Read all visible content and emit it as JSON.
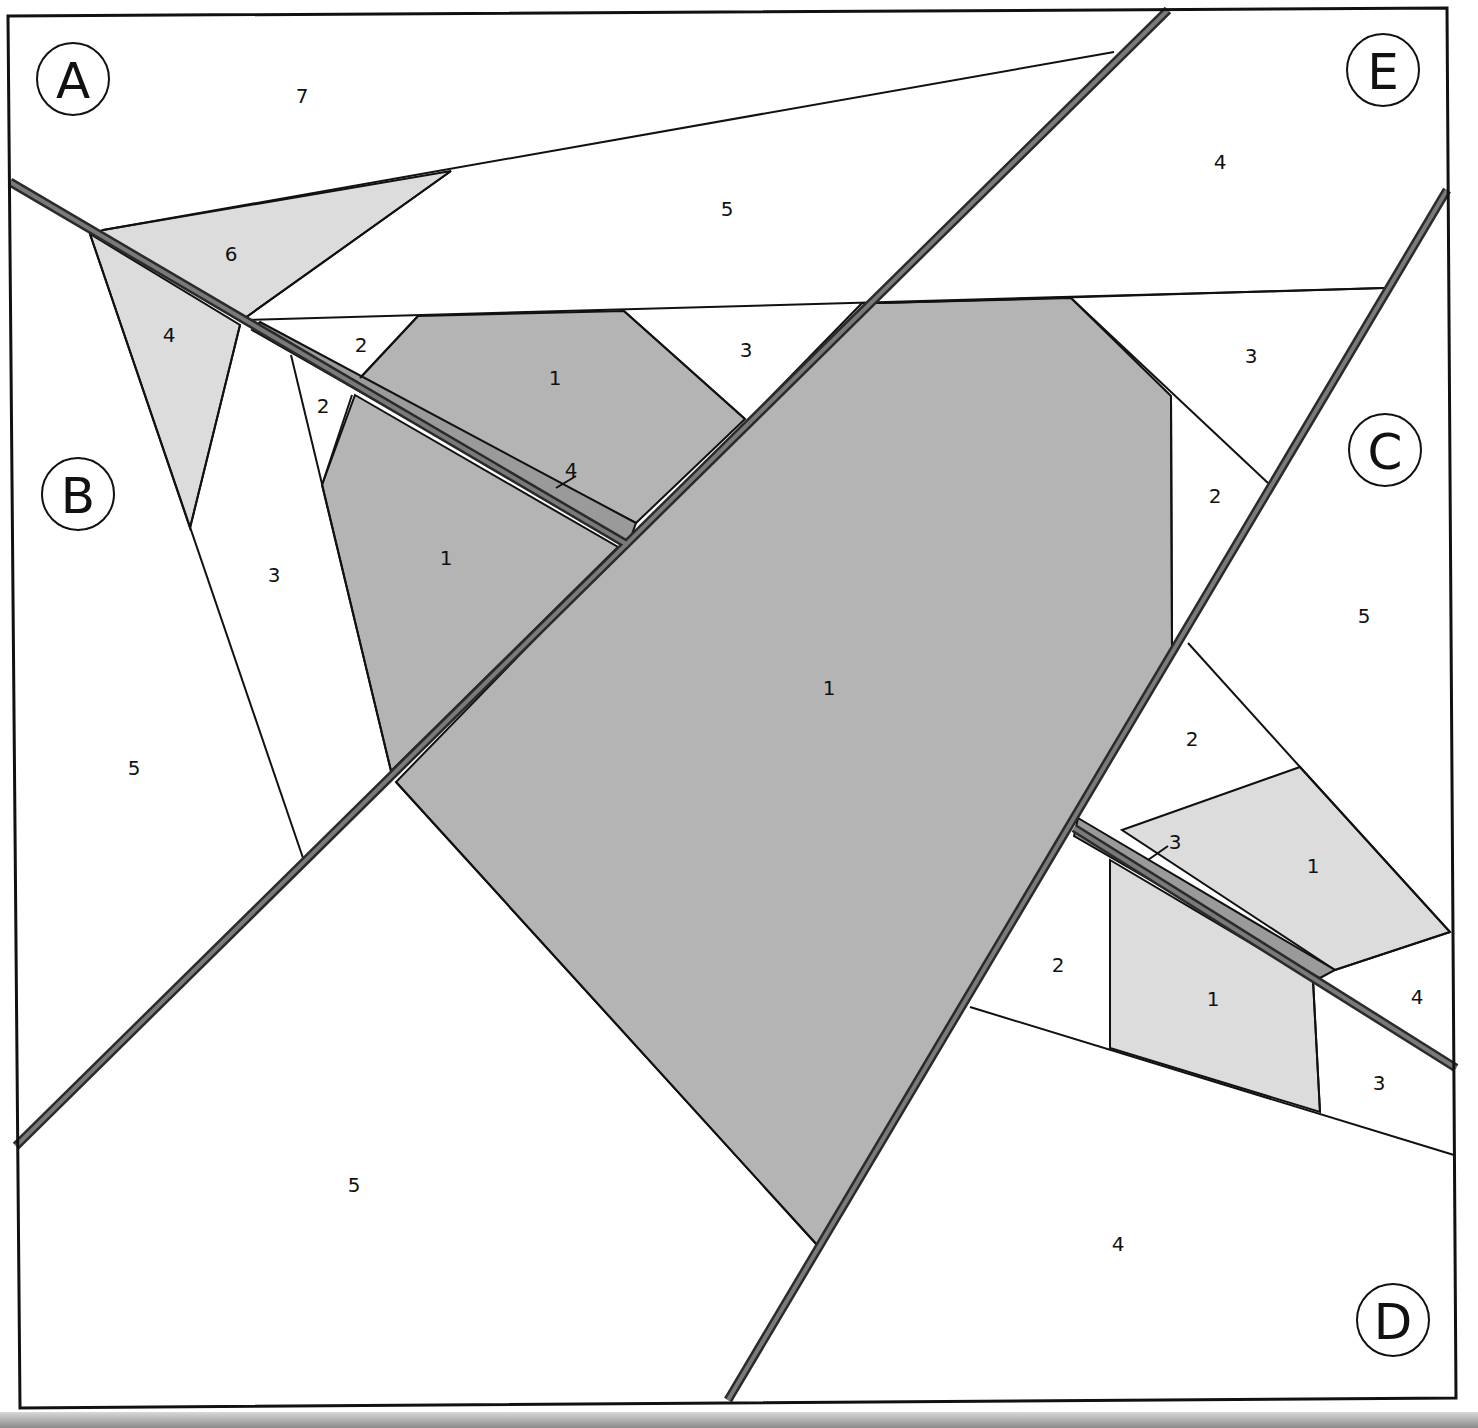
{
  "colors": {
    "dark_fill": "#b4b4b4",
    "light_fill": "#dcdcdc",
    "seam_fill": "#9a9a9a",
    "white": "#ffffff",
    "line": "#111111",
    "seam_outer": "#2a2a2a",
    "seam_inner": "#7a7a7a"
  },
  "sections": [
    {
      "id": "A",
      "x": 73,
      "y": 79
    },
    {
      "id": "B",
      "x": 78,
      "y": 494
    },
    {
      "id": "C",
      "x": 1385,
      "y": 450
    },
    {
      "id": "D",
      "x": 1393,
      "y": 1320
    },
    {
      "id": "E",
      "x": 1383,
      "y": 70
    }
  ],
  "piece_labels": [
    {
      "section": "A",
      "num": "7",
      "x": 302,
      "y": 97
    },
    {
      "section": "A",
      "num": "6",
      "x": 231,
      "y": 255
    },
    {
      "section": "A",
      "num": "5",
      "x": 727,
      "y": 210
    },
    {
      "section": "A",
      "num": "3",
      "x": 746,
      "y": 351
    },
    {
      "section": "A",
      "num": "2",
      "x": 361,
      "y": 346
    },
    {
      "section": "A",
      "num": "1",
      "x": 555,
      "y": 379
    },
    {
      "section": "A",
      "num": "4",
      "x": 571,
      "y": 471
    },
    {
      "section": "B",
      "num": "4",
      "x": 169,
      "y": 336
    },
    {
      "section": "B",
      "num": "2",
      "x": 323,
      "y": 407
    },
    {
      "section": "B",
      "num": "3",
      "x": 274,
      "y": 576
    },
    {
      "section": "B",
      "num": "1",
      "x": 446,
      "y": 559
    },
    {
      "section": "B",
      "num": "5",
      "x": 134,
      "y": 769
    },
    {
      "section": "E",
      "num": "4",
      "x": 1220,
      "y": 163
    },
    {
      "section": "E",
      "num": "3",
      "x": 1251,
      "y": 357
    },
    {
      "section": "E",
      "num": "2",
      "x": 1215,
      "y": 497
    },
    {
      "section": "E",
      "num": "1",
      "x": 829,
      "y": 689
    },
    {
      "section": "E",
      "num": "5",
      "x": 354,
      "y": 1186
    },
    {
      "section": "C",
      "num": "5",
      "x": 1364,
      "y": 617
    },
    {
      "section": "C",
      "num": "2",
      "x": 1192,
      "y": 740
    },
    {
      "section": "C",
      "num": "1",
      "x": 1313,
      "y": 867
    },
    {
      "section": "C",
      "num": "4",
      "x": 1417,
      "y": 998
    },
    {
      "section": "D",
      "num": "3",
      "x": 1175,
      "y": 843
    },
    {
      "section": "D",
      "num": "2",
      "x": 1058,
      "y": 966
    },
    {
      "section": "D",
      "num": "1",
      "x": 1213,
      "y": 1000
    },
    {
      "section": "D",
      "num": "3",
      "x": 1379,
      "y": 1084
    },
    {
      "section": "D",
      "num": "4",
      "x": 1118,
      "y": 1245
    }
  ]
}
